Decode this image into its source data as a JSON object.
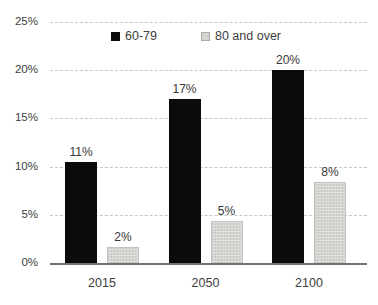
{
  "chart_data": {
    "type": "bar",
    "title": "",
    "xlabel": "",
    "ylabel": "",
    "categories": [
      "2015",
      "2050",
      "2100"
    ],
    "series": [
      {
        "name": "60-79",
        "color": "#0b0b0b",
        "values": [
          10.5,
          17,
          20
        ],
        "labels": [
          "11%",
          "17%",
          "20%"
        ]
      },
      {
        "name": "80 and over",
        "color": "#d3d3d0",
        "values": [
          1.7,
          4.4,
          8.4
        ],
        "labels": [
          "2%",
          "5%",
          "8%"
        ]
      }
    ],
    "ylim": [
      0,
      25
    ],
    "yticks": [
      0,
      5,
      10,
      15,
      20,
      25
    ],
    "ytick_labels": [
      "0%",
      "5%",
      "10%",
      "15%",
      "20%",
      "25%"
    ],
    "grid": "horizontal-dashed",
    "legend_position": "top-center",
    "style": {
      "gridline_color": "#c6c6c6",
      "axis_line_color": "#717171",
      "text_color": "#3d3d3d",
      "background": "#ffffff"
    }
  }
}
